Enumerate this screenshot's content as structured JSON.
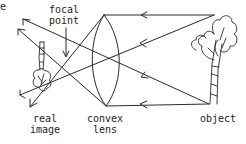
{
  "diagram": {
    "type": "ray-diagram",
    "colors": {
      "stroke": "#2a2a2a",
      "background": "#ffffff"
    },
    "labels": {
      "top_left_fragment": "e",
      "focal_point_line1": "focal",
      "focal_point_line2": "point",
      "real_image_line1": "real",
      "real_image_line2": "image",
      "lens_line1": "convex",
      "lens_line2": "lens",
      "object": "object"
    },
    "elements": [
      {
        "name": "object",
        "depiction": "upright tree",
        "position": "right"
      },
      {
        "name": "convex-lens",
        "depiction": "biconvex lens outline",
        "position": "center"
      },
      {
        "name": "focal-point",
        "depiction": "crossing of rays left of lens",
        "position": "center-left"
      },
      {
        "name": "real-image",
        "depiction": "small inverted tree",
        "position": "left"
      }
    ],
    "rays": [
      {
        "from": "object-top",
        "path": "parallel to axis, refracts through focal point",
        "arrows": 2
      },
      {
        "from": "object-top",
        "path": "through lens center",
        "arrows": 2
      },
      {
        "from": "object-base",
        "path": "through lens center",
        "arrows": 2
      },
      {
        "from": "object-base",
        "path": "parallel to axis, refracts through focal point",
        "arrows": 1
      }
    ]
  }
}
